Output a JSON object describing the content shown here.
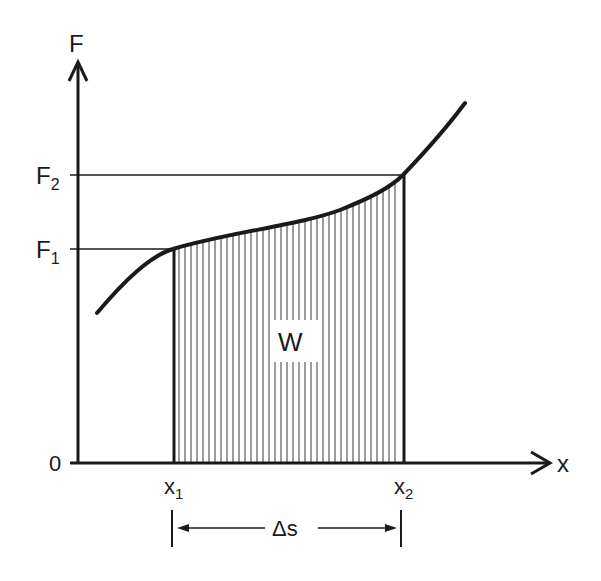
{
  "diagram": {
    "colors": {
      "ink": "#1a1a1a",
      "background": "#ffffff",
      "hatch": "#3a3a3a"
    },
    "axes": {
      "y_label": "F",
      "x_label": "x",
      "origin_label": "0"
    },
    "y_ticks": [
      {
        "label": "F",
        "sub": "1"
      },
      {
        "label": "F",
        "sub": "2"
      }
    ],
    "x_ticks": [
      {
        "label": "x",
        "sub": "1"
      },
      {
        "label": "x",
        "sub": "2"
      }
    ],
    "area_label": "W",
    "span_label": "Δs"
  }
}
